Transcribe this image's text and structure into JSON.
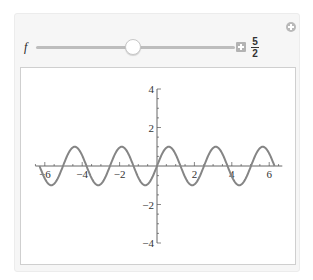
{
  "manipulate": {
    "add_control_icon": "circle-plus-icon",
    "control": {
      "variable_label": "f",
      "value_numerator": "5",
      "value_denominator": "2",
      "value": 2.5,
      "slider_position_fraction": 0.48,
      "animate_button_icon": "plus-box-icon"
    }
  },
  "colors": {
    "panel_bg": "#f6f6f6",
    "plot_bg": "#ffffff",
    "curve": "#858585",
    "axis": "#555555"
  },
  "chart_data": {
    "type": "line",
    "title": "",
    "function": "sin(f x)",
    "parameter_f": 2.5,
    "x_range": [
      -6.2832,
      6.2832
    ],
    "xlim": [
      -6.5,
      6.7
    ],
    "ylim": [
      -4,
      4
    ],
    "xlabel": "",
    "ylabel": "",
    "x_ticks": [
      -6,
      -4,
      -2,
      2,
      4,
      6
    ],
    "x_tick_labels": [
      "-6",
      "-4",
      "-2",
      "2",
      "4",
      "6"
    ],
    "y_ticks": [
      -4,
      -2,
      2,
      4
    ],
    "y_tick_labels": [
      "-4",
      "-2",
      "2",
      "4"
    ],
    "grid": false,
    "legend": null,
    "series": [
      {
        "name": "sin(2.5 x)",
        "amplitude": 1,
        "period": 2.5133
      }
    ]
  }
}
